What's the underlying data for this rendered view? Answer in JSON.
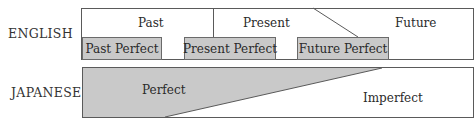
{
  "diagram": {
    "type": "tense-aspect comparison",
    "colors": {
      "fill_gray": "#c9c9c9",
      "line": "#555555",
      "background": "#ffffff"
    },
    "rows": [
      {
        "label": "ENGLISH",
        "tenses": [
          "Past",
          "Present",
          "Future"
        ],
        "perfect_boxes": [
          "Past Perfect",
          "Present Perfect",
          "Future Perfect"
        ]
      },
      {
        "label": "JAPANESE",
        "regions": [
          "Perfect",
          "Imperfect"
        ]
      }
    ]
  }
}
